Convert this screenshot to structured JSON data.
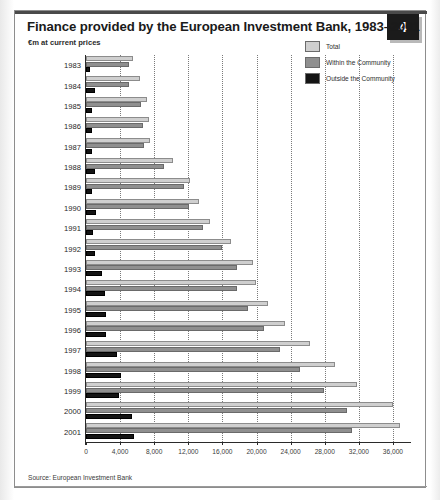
{
  "figure": {
    "badge_number": "4",
    "title": "Finance provided by the European Investment Bank, 1983–2001",
    "subtitle": "€m at current prices",
    "source": "Source: European Investment Bank"
  },
  "legend": {
    "items": [
      {
        "label": "Total",
        "color": "#cfcfcf"
      },
      {
        "label": "Within the Community",
        "color": "#8f8f8f"
      },
      {
        "label": "Outside the Community",
        "color": "#141414"
      }
    ]
  },
  "chart_data": {
    "type": "bar",
    "orientation": "horizontal",
    "title": "Finance provided by the European Investment Bank, 1983–2001",
    "subtitle": "€m at current prices",
    "xlabel": "",
    "ylabel": "",
    "xlim": [
      0,
      38000
    ],
    "xticks": [
      0,
      4000,
      8000,
      12000,
      16000,
      20000,
      24000,
      28000,
      32000,
      36000
    ],
    "xtick_labels": [
      "0",
      "4,000",
      "8,000",
      "12,000",
      "16,000",
      "20,000",
      "24,000",
      "28,000",
      "32,000",
      "36,000"
    ],
    "grid": true,
    "grid_axis": "x",
    "legend_position": "top-right",
    "categories": [
      "1983",
      "1984",
      "1985",
      "1986",
      "1987",
      "1988",
      "1989",
      "1990",
      "1991",
      "1992",
      "1993",
      "1994",
      "1995",
      "1996",
      "1997",
      "1998",
      "1999",
      "2000",
      "2001"
    ],
    "series": [
      {
        "name": "Total",
        "color": "#cfcfcf",
        "values": [
          5500,
          6300,
          7200,
          7400,
          7500,
          10200,
          12200,
          13300,
          14500,
          17000,
          19600,
          19900,
          21400,
          23300,
          26300,
          29200,
          31800,
          36000,
          36800
        ]
      },
      {
        "name": "Within the Community",
        "color": "#8f8f8f",
        "values": [
          5000,
          5000,
          6500,
          6700,
          6800,
          9100,
          11500,
          12100,
          13700,
          15900,
          17700,
          17700,
          19000,
          20900,
          22700,
          25100,
          27900,
          30600,
          31200
        ]
      },
      {
        "name": "Outside the Community",
        "color": "#141414",
        "values": [
          500,
          1100,
          700,
          700,
          700,
          1100,
          700,
          1200,
          800,
          1100,
          1900,
          2200,
          2400,
          2400,
          3600,
          4100,
          3900,
          5400,
          5600
        ]
      }
    ]
  }
}
